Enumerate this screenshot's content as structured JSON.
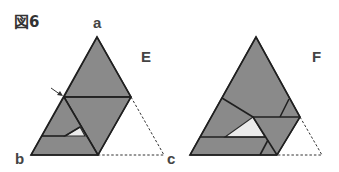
{
  "figure": {
    "title": "図6",
    "vertex_labels": {
      "a": "a",
      "b": "b",
      "c": "c"
    },
    "panels": [
      {
        "id": "E",
        "label": "E",
        "has_arrow_marker": true
      },
      {
        "id": "F",
        "label": "F",
        "has_arrow_marker": false
      }
    ],
    "colors": {
      "paper": "#8a8a8a",
      "outline": "#2b2b2b",
      "gap": "#ebebeb",
      "background": "#ffffff"
    }
  }
}
